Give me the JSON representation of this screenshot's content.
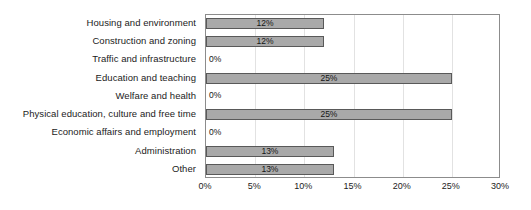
{
  "chart_data": {
    "type": "bar",
    "orientation": "horizontal",
    "title": "",
    "subtitle": "",
    "xlabel": "",
    "ylabel": "",
    "xlim": [
      0,
      30
    ],
    "grid": true,
    "legend": false,
    "legend_position": "none",
    "unit": "%",
    "categories": [
      "Housing and environment",
      "Construction and zoning",
      "Traffic and infrastructure",
      "Education and teaching",
      "Welfare and health",
      "Physical education, culture and free time",
      "Economic affairs and employment",
      "Administration",
      "Other"
    ],
    "values": [
      12,
      12,
      0,
      25,
      0,
      25,
      0,
      13,
      13
    ],
    "data_labels": [
      "12%",
      "12%",
      "0%",
      "25%",
      "0%",
      "25%",
      "0%",
      "13%",
      "13%"
    ],
    "xticks": [
      0,
      5,
      10,
      15,
      20,
      25,
      30
    ],
    "xtick_labels": [
      "0%",
      "5%",
      "10%",
      "15%",
      "20%",
      "25%",
      "30%"
    ],
    "colors": {
      "bar_fill": "#a9a9a9",
      "bar_border": "#595959",
      "gridline": "#e2e2e2",
      "axis_border": "#8c8c8c",
      "text": "#1b1b1b",
      "background": "#ffffff"
    }
  }
}
